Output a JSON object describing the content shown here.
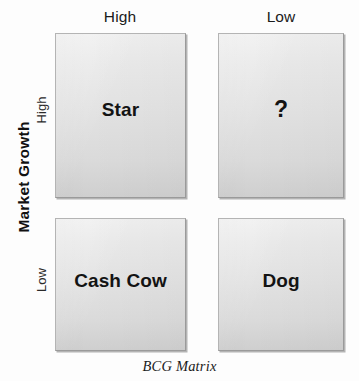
{
  "diagram": {
    "caption": "BCG Matrix",
    "y_axis_title": "Market Growth",
    "column_headers": [
      {
        "label": "High"
      },
      {
        "label": "Low"
      }
    ],
    "row_labels": [
      {
        "label": "High"
      },
      {
        "label": "Low"
      }
    ],
    "quadrants": [
      {
        "id": "star",
        "label": "Star",
        "row": "High",
        "column": "High"
      },
      {
        "id": "question",
        "label": "?",
        "row": "High",
        "column": "Low"
      },
      {
        "id": "cash_cow",
        "label": "Cash Cow",
        "row": "Low",
        "column": "High"
      },
      {
        "id": "dog",
        "label": "Dog",
        "row": "Low",
        "column": "Low"
      }
    ],
    "artifact_text": "",
    "colors": {
      "background": "#fdfdfd",
      "box_fill_top": "#efefef",
      "box_fill_bottom": "#cfcfcf",
      "box_border": "#b4b4b4",
      "text": "#131313"
    }
  },
  "chart_data": {
    "type": "table",
    "title": "BCG Matrix",
    "xlabel": "",
    "ylabel": "Market Growth",
    "columns": [
      "High",
      "Low"
    ],
    "rows": [
      "High",
      "Low"
    ],
    "cells": [
      [
        "Star",
        "?"
      ],
      [
        "Cash Cow",
        "Dog"
      ]
    ],
    "grid": false,
    "legend": "none"
  }
}
